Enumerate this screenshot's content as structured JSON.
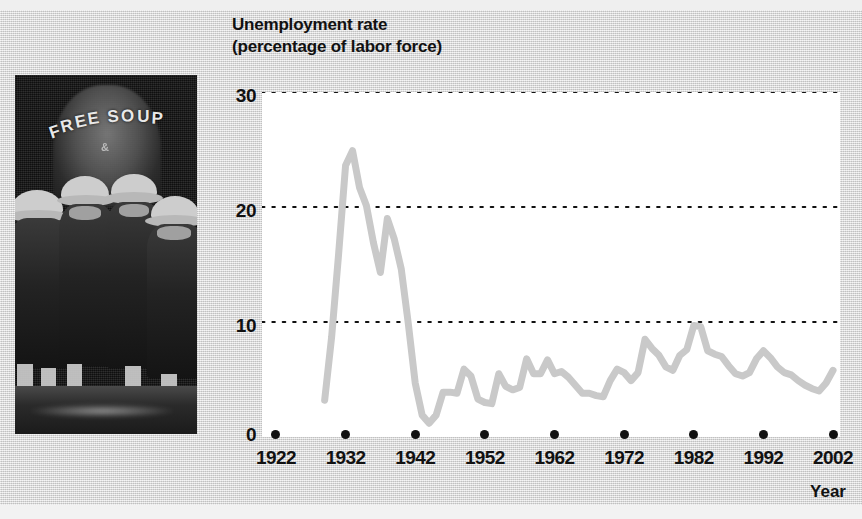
{
  "figure": {
    "background_color": "#d9d9d9",
    "plot_background_color": "#ffffff",
    "line_color": "#c9c9c9",
    "text_color": "#111111"
  },
  "photo": {
    "name": "depression-breadline-photo",
    "sign_text": "FREE SOUP",
    "sign_submark": "&",
    "caption": ""
  },
  "chart_data": {
    "type": "line",
    "title": "Unemployment rate",
    "subtitle": "(percentage of labor force)",
    "xlabel": "Year",
    "ylabel": "",
    "xlim": [
      1920,
      2003
    ],
    "ylim": [
      0,
      30
    ],
    "yticks": [
      0,
      10,
      20,
      30
    ],
    "xticks": [
      1922,
      1932,
      1942,
      1952,
      1962,
      1972,
      1982,
      1992,
      2002
    ],
    "grid": "horizontal-dotted",
    "legend": "none",
    "series": [
      {
        "name": "Unemployment rate",
        "color": "#c9c9c9",
        "x": [
          1929,
          1930,
          1931,
          1932,
          1933,
          1934,
          1935,
          1936,
          1937,
          1938,
          1939,
          1940,
          1941,
          1942,
          1943,
          1944,
          1945,
          1946,
          1947,
          1948,
          1949,
          1950,
          1951,
          1952,
          1953,
          1954,
          1955,
          1956,
          1957,
          1958,
          1959,
          1960,
          1961,
          1962,
          1963,
          1964,
          1965,
          1966,
          1967,
          1968,
          1969,
          1970,
          1971,
          1972,
          1973,
          1974,
          1975,
          1976,
          1977,
          1978,
          1979,
          1980,
          1981,
          1982,
          1983,
          1984,
          1985,
          1986,
          1987,
          1988,
          1989,
          1990,
          1991,
          1992,
          1993,
          1994,
          1995,
          1996,
          1997,
          1998,
          1999,
          2000,
          2001,
          2002
        ],
        "values": [
          3.2,
          8.7,
          15.9,
          23.6,
          24.9,
          21.7,
          20.1,
          16.9,
          14.3,
          19.0,
          17.2,
          14.6,
          9.9,
          4.7,
          1.9,
          1.2,
          1.9,
          3.9,
          3.9,
          3.8,
          5.9,
          5.3,
          3.3,
          3.0,
          2.9,
          5.5,
          4.4,
          4.1,
          4.3,
          6.8,
          5.5,
          5.5,
          6.7,
          5.5,
          5.7,
          5.2,
          4.5,
          3.8,
          3.8,
          3.6,
          3.5,
          4.9,
          5.9,
          5.6,
          4.9,
          5.6,
          8.5,
          7.7,
          7.1,
          6.1,
          5.8,
          7.1,
          7.6,
          9.7,
          9.6,
          7.5,
          7.2,
          7.0,
          6.2,
          5.5,
          5.3,
          5.6,
          6.8,
          7.5,
          6.9,
          6.1,
          5.6,
          5.4,
          4.9,
          4.5,
          4.2,
          4.0,
          4.7,
          5.8
        ]
      }
    ]
  }
}
